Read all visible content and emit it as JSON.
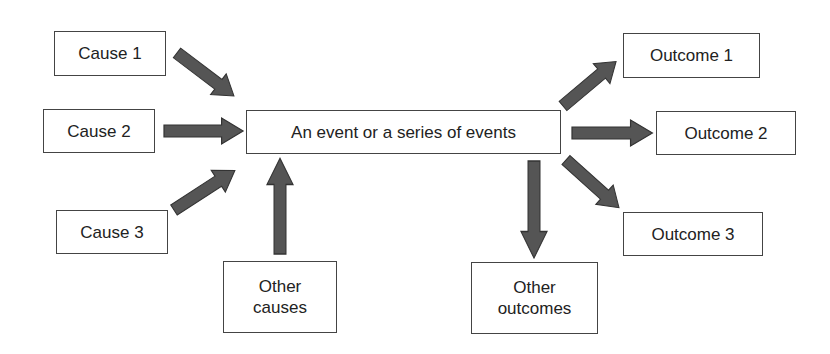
{
  "diagram": {
    "center": {
      "label": "An event or a series of events"
    },
    "causes": [
      {
        "label": "Cause 1"
      },
      {
        "label": "Cause 2"
      },
      {
        "label": "Cause 3"
      },
      {
        "label_line1": "Other",
        "label_line2": "causes"
      }
    ],
    "outcomes": [
      {
        "label": "Outcome 1"
      },
      {
        "label": "Outcome 2"
      },
      {
        "label": "Outcome 3"
      },
      {
        "label_line1": "Other",
        "label_line2": "outcomes"
      }
    ],
    "arrow_color": "#555555",
    "arrow_outline_color": "#333333",
    "box_border_color": "#444444"
  }
}
